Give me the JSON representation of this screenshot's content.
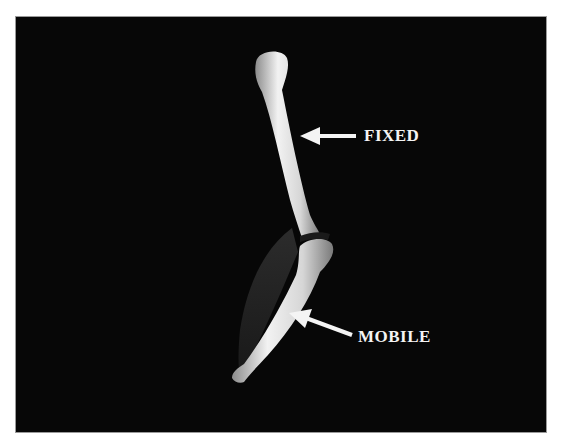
{
  "figure": {
    "labels": {
      "fixed": "FIXED",
      "mobile": "MOBILE"
    },
    "colors": {
      "background": "#070707",
      "bone": "#e6e6e6",
      "muscle": "#2a2a2a",
      "label": "#f4f4f4"
    }
  }
}
